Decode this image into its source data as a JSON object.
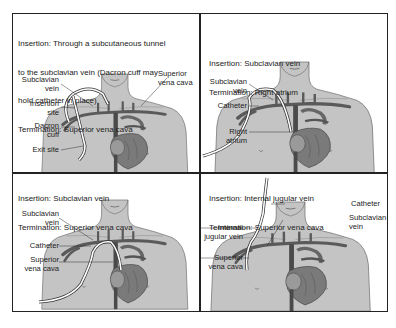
{
  "figure": {
    "panels": [
      {
        "id": "tunneled",
        "caption_lines": [
          "Insertion: Through a subcutaneous tunnel",
          "to the subclavian vein (Dacron cuff may",
          "hold catheter in place)",
          "Termination: Superior vena cava"
        ],
        "labels": {
          "subclavian_vein": "Subclavian\nvein",
          "insertion_site": "Insertion\nsite",
          "dacron_cuff": "Dacron\ncuff",
          "exit_site": "Exit site",
          "superior_vena_cava": "Superior\nvena cava"
        }
      },
      {
        "id": "subclavian-right-atrium",
        "caption_lines": [
          "Insertion: Subclavian vein",
          "Termination: Right atrium"
        ],
        "labels": {
          "subclavian_vein": "Subclavian\nvein",
          "catheter": "Catheter",
          "right_atrium": "Right\natrium"
        }
      },
      {
        "id": "subclavian-svc",
        "caption_lines": [
          "Insertion: Subclavian vein",
          "Termination: Superior vena cava"
        ],
        "labels": {
          "subclavian_vein": "Subclavian\nvein",
          "catheter": "Catheter",
          "superior_vena_cava": "Superior\nvena cava"
        }
      },
      {
        "id": "internal-jugular",
        "caption_lines": [
          "Insertion: Internal jugular vein",
          "Termination: Superior vena cava"
        ],
        "labels": {
          "catheter": "Catheter",
          "subclavian_vein": "Subclavian\nvein",
          "internal_jugular_vein": "Internal\njugular vein",
          "superior_vena_cava": "Superior\nvena cava"
        }
      }
    ],
    "colors": {
      "skin": "#c4c4c4",
      "skin_outline": "#6a6a6a",
      "vessel": "#5a5a5a",
      "heart": "#7a7a7a",
      "catheter": "#ffffff",
      "border": "#222222"
    }
  }
}
